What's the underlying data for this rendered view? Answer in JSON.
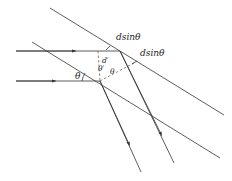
{
  "diagram": {
    "labels": {
      "path_diff_top": "dsinθ",
      "path_diff_right": "dsinθ",
      "spacing": "d′",
      "angle_prime": "θ′",
      "angle_inner": "θ",
      "angle_incident": "θ"
    },
    "elements": {
      "planes": 2,
      "incident_rays": 2,
      "reflected_rays": 2
    },
    "colors": {
      "line": "#333333",
      "background": "#ffffff"
    }
  }
}
